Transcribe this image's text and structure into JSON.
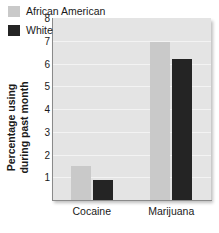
{
  "chart_data": {
    "type": "bar",
    "title": "",
    "xlabel": "",
    "ylabel_lines": [
      "Percentage using",
      "during past month"
    ],
    "categories": [
      "Cocaine",
      "Marijuana"
    ],
    "series": [
      {
        "name": "African American",
        "color": "#c9c9c9",
        "values": [
          1.5,
          6.95
        ]
      },
      {
        "name": "White",
        "color": "#242424",
        "values": [
          0.9,
          6.2
        ]
      }
    ],
    "ylim": [
      0,
      8
    ],
    "yticks": [
      1,
      2,
      3,
      4,
      5,
      6,
      7,
      8
    ],
    "ytick_labels": [
      "1",
      "2",
      "3",
      "4",
      "5",
      "6",
      "7",
      "8"
    ],
    "grid": true,
    "legend_position": "top-left-inside",
    "plot_background": "#e4e4e4",
    "gridline_color": "#f3f3f3",
    "axis_color": "#8a8a8a"
  }
}
